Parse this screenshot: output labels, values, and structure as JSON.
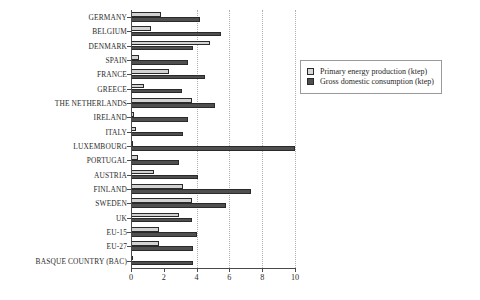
{
  "chart_data": {
    "type": "bar",
    "orientation": "horizontal",
    "title": "",
    "xlabel": "",
    "ylabel": "",
    "xlim": [
      0,
      10
    ],
    "xticks": [
      0,
      2,
      4,
      6,
      8,
      10
    ],
    "gridlines": [
      4,
      6,
      8,
      10
    ],
    "grid": true,
    "legend_position": "upper right",
    "categories": [
      "GERMANY",
      "BELGIUM",
      "DENMARK",
      "SPAIN",
      "FRANCE",
      "GREECE",
      "THE NETHERLANDS",
      "IRELAND",
      "ITALY",
      "LUXEMBOURG",
      "PORTUGAL",
      "AUSTRIA",
      "FINLAND",
      "SWEDEN",
      "UK",
      "EU-15",
      "EU-27",
      "BASQUE COUNTRY (BAC)"
    ],
    "series": [
      {
        "name": "Primary energy production (ktep)",
        "color": "#d2d2d2",
        "values": [
          1.8,
          1.2,
          4.8,
          0.5,
          2.3,
          0.8,
          3.7,
          0.2,
          0.3,
          0.1,
          0.4,
          1.4,
          3.2,
          3.7,
          2.9,
          1.7,
          1.7,
          0.15
        ]
      },
      {
        "name": "Gross domestic consumption (ktep)",
        "color": "#4f4f4f",
        "values": [
          4.2,
          5.5,
          3.8,
          3.5,
          4.5,
          3.1,
          5.1,
          3.5,
          3.2,
          10.0,
          2.9,
          4.1,
          7.3,
          5.8,
          3.7,
          4.0,
          3.8,
          3.8
        ]
      }
    ]
  },
  "legend": {
    "items": [
      {
        "label": "Primary energy production (ktep)",
        "swatch": "production"
      },
      {
        "label": "Gross domestic consumption (ktep)",
        "swatch": "consumption"
      }
    ]
  }
}
